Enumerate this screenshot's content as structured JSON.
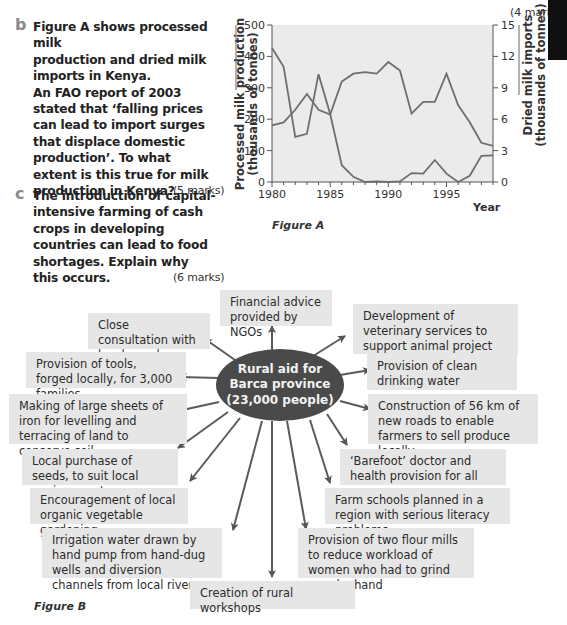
{
  "top_marks": "(4 marks)",
  "questions": [
    {
      "letter": "b",
      "lines": [
        "Figure A shows processed milk",
        "production and dried milk",
        "imports in Kenya.",
        "An FAO report of 2003",
        "stated that ‘falling prices",
        "can lead to import surges",
        "that displace domestic",
        "production’. To what",
        "extent is this true for milk",
        "production in Kenya?"
      ],
      "marks": "(5 marks)"
    },
    {
      "letter": "c",
      "lines": [
        "The introduction of capital-",
        "intensive farming of cash",
        "crops in developing",
        "countries can lead to food",
        "shortages. Explain why",
        "this occurs."
      ],
      "marks": "(6 marks)"
    }
  ],
  "figure_a": {
    "caption": "Figure A",
    "left_axis_label_1": "Processed milk production",
    "left_axis_label_2": "(thousands of tonnes)",
    "right_axis_label_1": "Dried milk imports",
    "right_axis_label_2": "(thousands of tonnes)",
    "x_label": "Year",
    "left_ticks": [
      "0",
      "100",
      "200",
      "300",
      "400",
      "500"
    ],
    "right_ticks": [
      "0",
      "3",
      "6",
      "9",
      "12",
      "15"
    ],
    "x_ticks": [
      "1980",
      "1985",
      "1990",
      "1995"
    ]
  },
  "chart_data": {
    "type": "line",
    "title": "Figure A",
    "xlabel": "Year",
    "ylabel": "Processed milk production (thousands of tonnes)",
    "y2label": "Dried milk imports (thousands of tonnes)",
    "x": [
      1980,
      1981,
      1982,
      1983,
      1984,
      1985,
      1986,
      1987,
      1988,
      1989,
      1990,
      1991,
      1992,
      1993,
      1994,
      1995,
      1996,
      1997,
      1998,
      1999
    ],
    "ylim": [
      0,
      500
    ],
    "y2lim": [
      0,
      15
    ],
    "grid": false,
    "series": [
      {
        "name": "Processed milk production",
        "axis": "left",
        "values": [
          180,
          190,
          230,
          280,
          230,
          215,
          320,
          345,
          350,
          345,
          382,
          355,
          218,
          255,
          255,
          345,
          245,
          190,
          125,
          115
        ]
      },
      {
        "name": "Dried milk imports",
        "axis": "right",
        "values": [
          12.8,
          11.0,
          4.3,
          4.6,
          10.3,
          6.5,
          1.6,
          0.5,
          0.0,
          0.05,
          0.0,
          0.05,
          0.85,
          0.8,
          2.1,
          0.8,
          0.0,
          0.6,
          2.5,
          2.55
        ]
      }
    ]
  },
  "figure_b": {
    "caption": "Figure B",
    "center_lines": [
      "Rural aid for",
      "Barca province",
      "(23,000 people)"
    ],
    "boxes": [
      {
        "id": "financial",
        "text": "Financial advice provided by NGOs"
      },
      {
        "id": "consultation",
        "text": "Close consultation with local people"
      },
      {
        "id": "veterinary",
        "text": "Development of veterinary services to support animal project"
      },
      {
        "id": "tools",
        "text": "Provision of tools, forged locally, for 3,000 families"
      },
      {
        "id": "water",
        "text": "Provision of clean drinking water"
      },
      {
        "id": "iron",
        "text": "Making of large sheets of iron for levelling and terracing of land to conserve soil"
      },
      {
        "id": "roads",
        "text": "Construction of 56 km of new roads to enable farmers to sell produce locally"
      },
      {
        "id": "seeds",
        "text": "Local purchase of seeds, to suit local environment"
      },
      {
        "id": "barefoot",
        "text": "‘Barefoot’ doctor and health provision for all"
      },
      {
        "id": "gardening",
        "text": "Encouragement of local organic vegetable gardening"
      },
      {
        "id": "schools",
        "text": "Farm schools planned in a region with serious literacy problems"
      },
      {
        "id": "irrigation",
        "text": "Irrigation water drawn by hand pump from hand-dug wells and diversion channels from local rivers"
      },
      {
        "id": "mills",
        "text": "Provision of two flour mills to reduce workload of women who had to grind corn by hand"
      },
      {
        "id": "workshops",
        "text": "Creation of rural workshops"
      }
    ]
  }
}
